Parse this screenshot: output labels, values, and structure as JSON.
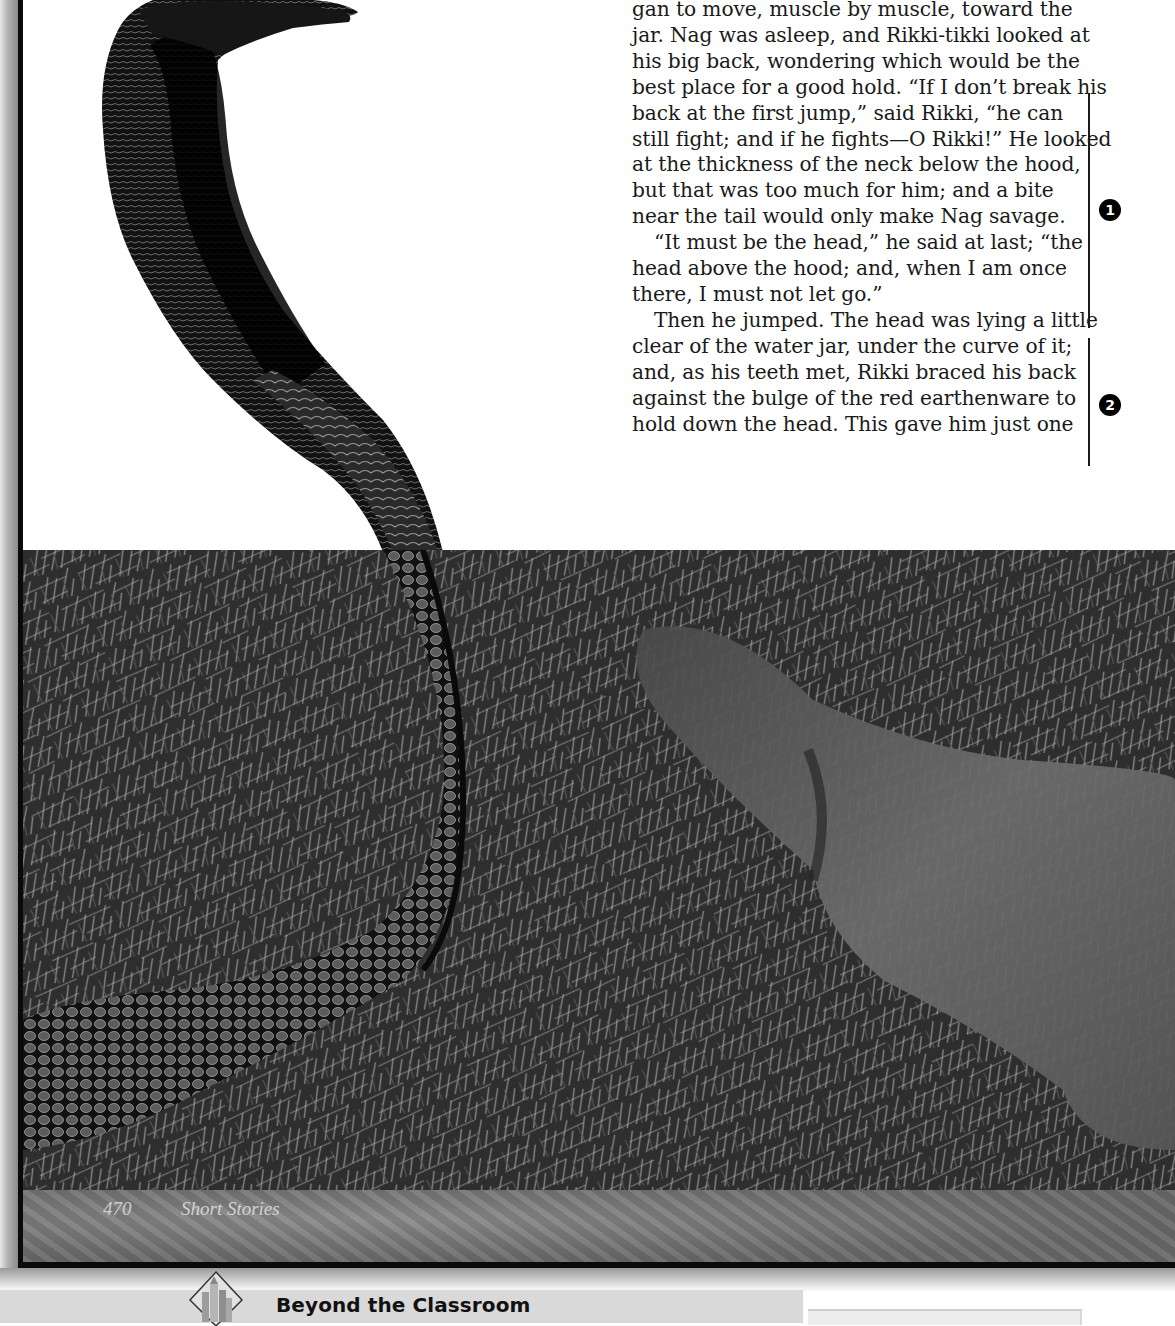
{
  "page": {
    "story_text": {
      "paragraph_1_lines": [
        "gan to move, muscle by muscle, toward the",
        "jar. Nag was asleep, and Rikki-tikki looked at",
        "his big back, wondering which would be the",
        "best place for a good hold. “If I don’t break his",
        "back at the first jump,” said Rikki, “he can",
        "still fight; and if he fights—O Rikki!” He looked",
        "at the thickness of the neck below the hood,",
        "but that was too much for him; and a bite",
        "near the tail would only make Nag savage."
      ],
      "paragraph_2_lines": [
        "“It must be the head,” he said at last; “the",
        "head above the hood; and, when I am once",
        "there, I must not let go.”"
      ],
      "paragraph_3_lines": [
        "Then he jumped. The head was lying a little",
        "clear of the water jar, under the curve of it;",
        "and, as his teeth met, Rikki braced his back",
        "against the bulge of the red earthenware to",
        "hold down the head. This gave him just one"
      ]
    },
    "margin_notes": [
      {
        "number": "1"
      },
      {
        "number": "2"
      }
    ],
    "photo": {
      "description": "Cobra rearing up facing a blurred mongoose in dry grass"
    },
    "footer": {
      "page_number": "470",
      "section_name": "Short Stories"
    },
    "feature_bar": {
      "icon": "castle-diamond-icon",
      "title": "Beyond the Classroom"
    }
  }
}
